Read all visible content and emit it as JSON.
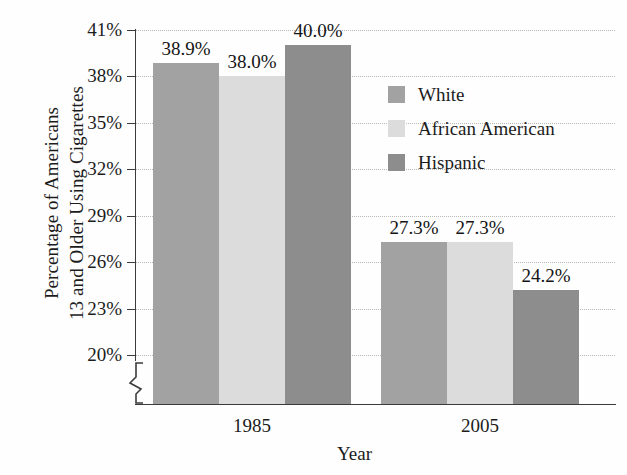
{
  "chart_data": {
    "type": "bar",
    "title": "",
    "xlabel": "Year",
    "ylabel": "Percentage of Americans 13 and Older Using Cigarettes",
    "ylabel_lines": [
      "Percentage of Americans",
      "13 and Older Using Cigarettes"
    ],
    "categories": [
      "1985",
      "2005"
    ],
    "series": [
      {
        "name": "White",
        "values": [
          38.9,
          27.3
        ],
        "labels": [
          "38.9%",
          "27.3%"
        ],
        "color": "#a2a2a2"
      },
      {
        "name": "African American",
        "values": [
          38.0,
          27.3
        ],
        "labels": [
          "38.0%",
          "27.3%"
        ],
        "color": "#dcdcdc"
      },
      {
        "name": "Hispanic",
        "values": [
          40.0,
          24.2
        ],
        "labels": [
          "40.0%",
          "24.2%"
        ],
        "color": "#8d8d8d"
      }
    ],
    "ylim": [
      20,
      41
    ],
    "ytick_values": [
      41,
      38,
      35,
      32,
      29,
      26,
      23,
      20
    ],
    "ytick_labels": [
      "41%",
      "38%",
      "35%",
      "32%",
      "29%",
      "26%",
      "23%",
      "20%"
    ],
    "grid": true,
    "axis_break": true,
    "legend_position": "inside-right",
    "legend_entries": [
      "White",
      "African American",
      "Hispanic"
    ]
  }
}
